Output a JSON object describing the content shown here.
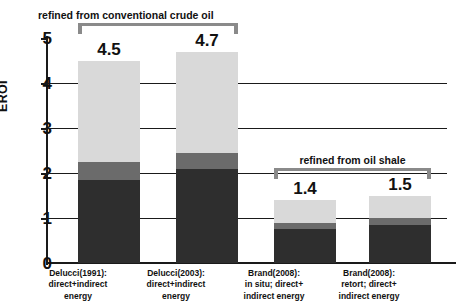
{
  "chart_data": {
    "type": "bar",
    "stacked": true,
    "title": "",
    "xlabel": "",
    "ylabel": "EROI",
    "ylim": [
      0,
      5
    ],
    "yticks": [
      "0",
      "1",
      "2",
      "3",
      "4",
      "5"
    ],
    "grid": true,
    "legend": "none",
    "categories": [
      "Delucci(1991): direct+indirect energy",
      "Delucci(2003): direct+indirect energy",
      "Brand(2008): in situ; direct+indirect energy",
      "Brand(2008): retort; direct+ indirect energy"
    ],
    "category_lines": [
      [
        "Delucci(1991):",
        "direct+indirect",
        "energy"
      ],
      [
        "Delucci(2003):",
        "direct+indirect",
        "energy"
      ],
      [
        "Brand(2008):",
        "in situ; direct+",
        "indirect energy"
      ],
      [
        "Brand(2008):",
        "retort; direct+",
        "indirect energy"
      ]
    ],
    "totals": [
      4.5,
      4.7,
      1.4,
      1.5
    ],
    "total_labels": [
      "4.5",
      "4.7",
      "1.4",
      "1.5"
    ],
    "series": [
      {
        "name": "dark-segment",
        "color": "#2e2e2e",
        "values": [
          1.85,
          2.1,
          0.75,
          0.85
        ]
      },
      {
        "name": "mid-gray-segment",
        "color": "#6b6b6b",
        "values": [
          0.4,
          0.35,
          0.15,
          0.15
        ]
      },
      {
        "name": "light-gray-segment",
        "color": "#d9d9d9",
        "values": [
          2.25,
          2.25,
          0.5,
          0.5
        ]
      }
    ],
    "annotations": [
      {
        "name": "bracket-crude",
        "text": "refined from conventional crude oil",
        "spans_categories": [
          0,
          1
        ]
      },
      {
        "name": "bracket-shale",
        "text": "refined from oil shale",
        "spans_categories": [
          2,
          3
        ]
      }
    ],
    "colors": {
      "axis": "#1a1a1a",
      "bracket": "#8a8a8a",
      "background": "#ffffff",
      "text": "#111111"
    }
  }
}
